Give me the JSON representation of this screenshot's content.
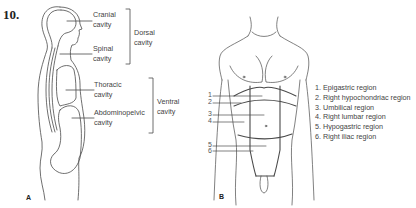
{
  "question_number": "10.",
  "panel_a": {
    "letter": "A",
    "labels": {
      "cranial": [
        "Cranial",
        "cavity"
      ],
      "spinal": [
        "Spinal",
        "cavity"
      ],
      "thoracic": [
        "Thoracic",
        "cavity"
      ],
      "abdominopelvic": [
        "Abdominopelvic",
        "cavity"
      ]
    },
    "groups": {
      "dorsal": [
        "Dorsal",
        "cavity"
      ],
      "ventral": [
        "Ventral",
        "cavity"
      ]
    }
  },
  "panel_b": {
    "letter": "B",
    "pointer_numbers": [
      "1",
      "2",
      "3",
      "4",
      "5",
      "6"
    ],
    "legend": [
      "1. Epigastric region",
      "2. Right hypochondriac region",
      "3. Umbilical region",
      "4. Right lumbar region",
      "5. Hypogastric region",
      "6. Right iliac region"
    ]
  },
  "colors": {
    "line": "#4a4a4a",
    "text": "#444444"
  }
}
